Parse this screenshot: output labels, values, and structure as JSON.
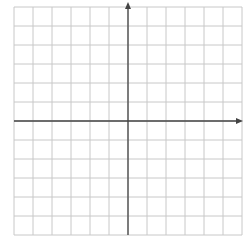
{
  "chart_data": {
    "type": "coordinate-grid",
    "xlim": [
      -6,
      6
    ],
    "ylim": [
      -6,
      6
    ],
    "grid": true,
    "x_axis_label": "x",
    "y_axis_label": "y",
    "origin_label": "O",
    "x_ticks": [
      "-5",
      "-4",
      "-3",
      "-2",
      "-1",
      "1",
      "2",
      "3",
      "4",
      "5"
    ],
    "y_ticks": [
      "5",
      "4",
      "3",
      "2",
      "1",
      "-1",
      "-2",
      "-3",
      "-4",
      "-5"
    ],
    "shapes": [
      {
        "label": "A",
        "vertices": [
          [
            -1,
            -3
          ],
          [
            0,
            -3
          ],
          [
            1,
            -5
          ],
          [
            -1,
            -4
          ]
        ],
        "label_pos": [
          -0.6,
          -3.7
        ]
      },
      {
        "label": "B",
        "vertices": [
          [
            3,
            4
          ],
          [
            4,
            4
          ],
          [
            5,
            2
          ],
          [
            3,
            3
          ]
        ],
        "label_pos": [
          3.7,
          3.4
        ]
      },
      {
        "label": "C",
        "vertices": [
          [
            -3,
            1
          ],
          [
            -2,
            1
          ],
          [
            -1,
            -1
          ],
          [
            -3,
            0
          ]
        ],
        "label_pos": [
          -2.6,
          0.5
        ]
      }
    ]
  }
}
